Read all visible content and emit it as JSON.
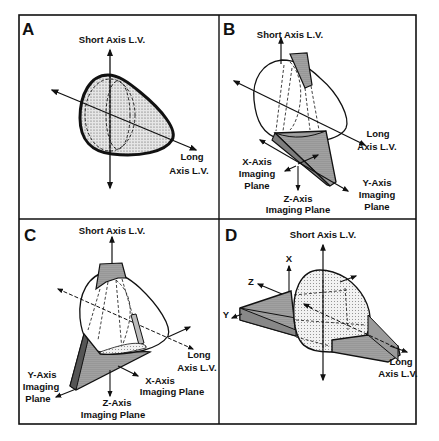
{
  "figure": {
    "colors": {
      "ink": "#111111",
      "shade": "#9a9a9a",
      "light_shade": "#d2d2d2",
      "background": "#ffffff"
    },
    "panels": [
      {
        "id": "A",
        "letter": "A",
        "short_axis_label": "Short Axis L.V.",
        "long_axis_label": [
          "Long",
          "Axis L.V."
        ]
      },
      {
        "id": "B",
        "letter": "B",
        "short_axis_label": "Short Axis L.V.",
        "long_axis_label": [
          "Long",
          "Axis L.V."
        ],
        "x_plane_label": [
          "X-Axis",
          "Imaging",
          "Plane"
        ],
        "z_plane_label": [
          "Z-Axis",
          "Imaging Plane"
        ],
        "y_plane_label": [
          "Y-Axis",
          "Imaging",
          "Plane"
        ]
      },
      {
        "id": "C",
        "letter": "C",
        "short_axis_label": "Short Axis L.V.",
        "long_axis_label": [
          "Long",
          "Axis L.V."
        ],
        "y_plane_label": [
          "Y-Axis",
          "Imaging",
          "Plane"
        ],
        "x_plane_label": [
          "X-Axis",
          "Imaging Plane"
        ],
        "z_plane_label": [
          "Z-Axis",
          "Imaging Plane"
        ]
      },
      {
        "id": "D",
        "letter": "D",
        "short_axis_label": "Short Axis L.V.",
        "long_axis_label": [
          "Long",
          "Axis L.V."
        ],
        "axis_x": "X",
        "axis_y": "Y",
        "axis_z": "Z"
      }
    ]
  }
}
